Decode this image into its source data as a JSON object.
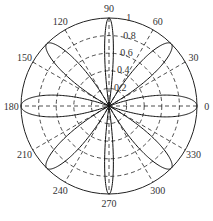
{
  "chart_data": {
    "type": "polar-line",
    "title": "",
    "center": [
      109,
      106
    ],
    "radius_px": 88,
    "rlim": [
      0,
      1
    ],
    "r_ticks": [
      0.2,
      0.4,
      0.6,
      0.8,
      1
    ],
    "r_tick_labels": [
      "0.2",
      "0.4",
      "0.6",
      "0.8",
      "1"
    ],
    "theta_ticks": [
      0,
      30,
      60,
      90,
      120,
      150,
      180,
      210,
      240,
      270,
      300,
      330
    ],
    "theta_tick_labels": [
      "0",
      "30",
      "60",
      "90",
      "120",
      "150",
      "180",
      "210",
      "240",
      "270",
      "300",
      "330"
    ],
    "grid": "dashed",
    "lobes": [
      {
        "angle": 0,
        "r": 1,
        "half_width_deg": 20
      },
      {
        "angle": 45,
        "r": 1,
        "half_width_deg": 16
      },
      {
        "angle": 90,
        "r": 1,
        "half_width_deg": 8
      },
      {
        "angle": 135,
        "r": 1,
        "half_width_deg": 16
      },
      {
        "angle": 180,
        "r": 1,
        "half_width_deg": 20
      },
      {
        "angle": 225,
        "r": 1,
        "half_width_deg": 16
      },
      {
        "angle": 270,
        "r": 1,
        "half_width_deg": 8
      },
      {
        "angle": 315,
        "r": 1,
        "half_width_deg": 16
      }
    ]
  }
}
